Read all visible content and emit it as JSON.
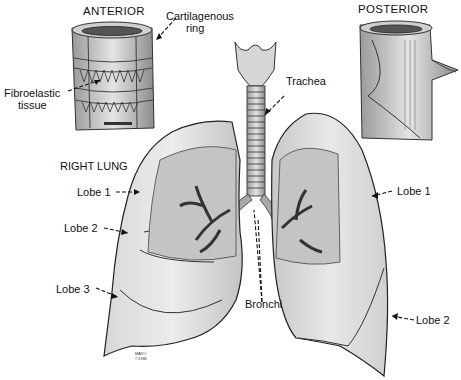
{
  "diagram": {
    "title_views": {
      "anterior": "ANTERIOR",
      "posterior": "POSTERIOR"
    },
    "section_heading": "RIGHT LUNG",
    "labels": {
      "cartilagenous_ring_line1": "Cartilagenous",
      "cartilagenous_ring_line2": "ring",
      "fibroelastic_line1": "Fibroelastic",
      "fibroelastic_line2": "tissue",
      "trachea": "Trachea",
      "bronchi": "Bronchi",
      "right_lobe_1": "Lobe 1",
      "right_lobe_2": "Lobe 2",
      "right_lobe_3": "Lobe 3",
      "left_lobe_1": "Lobe 1",
      "left_lobe_2": "Lobe 2"
    },
    "signature_line1": "MAYO",
    "signature_line2": "©1986",
    "colors": {
      "ink": "#111111",
      "tissue_light": "#e6e6e6",
      "tissue_mid": "#c8c8c8",
      "tissue_dark": "#8a8a8a",
      "background": "#ffffff"
    }
  }
}
